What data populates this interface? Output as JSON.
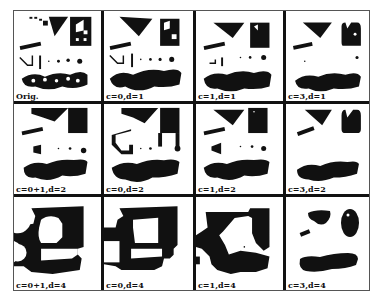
{
  "figure": {
    "panels": [
      {
        "id": "orig",
        "caption": "Orig."
      },
      {
        "id": "c0_d1",
        "caption": "c=0,d=1"
      },
      {
        "id": "c1_d1",
        "caption": "c=1,d=1"
      },
      {
        "id": "c3_d1",
        "caption": "c=3,d=1"
      },
      {
        "id": "c01_d2",
        "caption": "c=0+1,d=2"
      },
      {
        "id": "c0_d2",
        "caption": "c=0,d=2"
      },
      {
        "id": "c1_d2",
        "caption": "c=1,d=2"
      },
      {
        "id": "c3_d2",
        "caption": "c=3,d=2"
      },
      {
        "id": "c01_d4",
        "caption": "c=0+1,d=4"
      },
      {
        "id": "c0_d4",
        "caption": "c=0,d=4"
      },
      {
        "id": "c1_d4",
        "caption": "c=1,d=4"
      },
      {
        "id": "c3_d4",
        "caption": "c=3,d=4"
      }
    ],
    "colors": {
      "ink": "#111111",
      "paper": "#ffffff"
    }
  }
}
